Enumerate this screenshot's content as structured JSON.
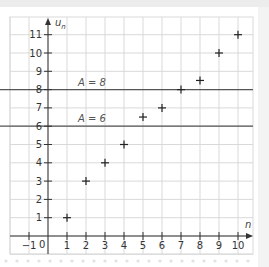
{
  "chart_data": {
    "type": "scatter",
    "title": "",
    "xlabel": "n",
    "ylabel": "u_n",
    "xlim": [
      -2,
      10.8
    ],
    "ylim": [
      -1,
      12
    ],
    "grid": true,
    "x_ticks": [
      -1,
      1,
      2,
      3,
      4,
      5,
      6,
      7,
      8,
      9,
      10
    ],
    "y_ticks": [
      1,
      2,
      3,
      4,
      5,
      6,
      7,
      8,
      9,
      10,
      11
    ],
    "origin_label": "0",
    "series": [
      {
        "name": "u_n",
        "marker": "+",
        "x": [
          1,
          2,
          3,
          4,
          5,
          6,
          7,
          8,
          9,
          10
        ],
        "y": [
          1,
          3,
          4,
          5,
          6.5,
          7,
          8,
          8.5,
          10,
          11
        ]
      }
    ],
    "horizontal_lines": [
      {
        "y": 8,
        "label": "A = 8"
      },
      {
        "y": 6,
        "label": "A = 6"
      }
    ],
    "colors": {
      "grid": "#d9d9d9",
      "axis": "#333333",
      "reference_line": "#555555",
      "marker": "#222222"
    }
  }
}
